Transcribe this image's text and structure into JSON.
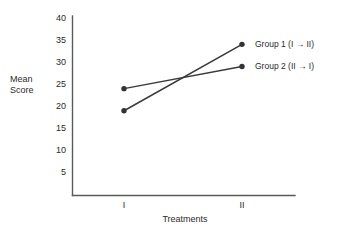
{
  "chart_data": {
    "type": "line",
    "title": "",
    "xlabel": "Treatments",
    "ylabel": "Mean Score",
    "categories": [
      "I",
      "II"
    ],
    "x": [
      1,
      2
    ],
    "ylim": [
      0,
      42
    ],
    "yticks": [
      5,
      10,
      15,
      20,
      25,
      30,
      35,
      40
    ],
    "ytick_labels": [
      "5",
      "10",
      "15",
      "20",
      "25",
      "30",
      "35",
      "40"
    ],
    "xtick_labels": [
      "I",
      "II"
    ],
    "grid": false,
    "legend_position": "right-inline",
    "series": [
      {
        "name": "Group 1 (I → II)",
        "values": [
          20,
          35
        ],
        "color": "#3a3a3a",
        "marker": "circle"
      },
      {
        "name": "Group 2 (II → I)",
        "values": [
          25,
          30
        ],
        "color": "#3a3a3a",
        "marker": "circle"
      }
    ],
    "annotations": [
      {
        "text": "Group 1 (I → II)",
        "anchor_series": 0
      },
      {
        "text": "Group 2 (II → I)",
        "anchor_series": 1
      }
    ]
  },
  "axes": {
    "y_label_line1": "Mean",
    "y_label_line2": "Score",
    "x_title": "Treatments",
    "y_ticks": [
      "40",
      "35",
      "30",
      "25",
      "20",
      "15",
      "10",
      "5"
    ],
    "x_ticks": [
      "I",
      "II"
    ]
  },
  "legend": {
    "items": [
      {
        "label": "Group 1 (I → II)"
      },
      {
        "label": "Group 2 (II → I)"
      }
    ]
  },
  "colors": {
    "line": "#3a3a3a",
    "axis": "#5a5a5a",
    "text": "#2b2b2b",
    "background": "#ffffff"
  }
}
